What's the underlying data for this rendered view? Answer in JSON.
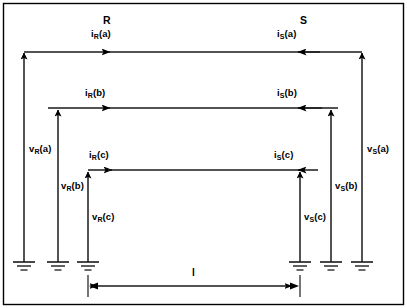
{
  "figure": {
    "type": "electrical-transmission-line-diagram",
    "border_color": "#000000",
    "line_color": "#1a1a1a",
    "background": "#ffffff",
    "width": 407,
    "height": 308
  },
  "terminals": {
    "left": {
      "label": "R",
      "x": 108,
      "y": 18
    },
    "right": {
      "label": "S",
      "x": 305,
      "y": 18
    }
  },
  "currents": {
    "left": [
      {
        "var": "i",
        "sub": "R",
        "arg": "(a)",
        "text": "iR(a)",
        "x": 94,
        "y": 31
      },
      {
        "var": "i",
        "sub": "R",
        "arg": "(b)",
        "text": "iR(b)",
        "x": 88,
        "y": 90
      },
      {
        "var": "i",
        "sub": "R",
        "arg": "(c)",
        "text": "iR(c)",
        "x": 92,
        "y": 152
      }
    ],
    "right": [
      {
        "var": "i",
        "sub": "S",
        "arg": "(a)",
        "text": "iS(a)",
        "x": 280,
        "y": 31
      },
      {
        "var": "i",
        "sub": "S",
        "arg": "(b)",
        "text": "iS(b)",
        "x": 280,
        "y": 90
      },
      {
        "var": "i",
        "sub": "S",
        "arg": "(c)",
        "text": "iS(c)",
        "x": 277,
        "y": 152
      }
    ]
  },
  "voltages": {
    "left": [
      {
        "var": "v",
        "sub": "R",
        "arg": "(a)",
        "text": "vR(a)",
        "x": 29,
        "y": 146
      },
      {
        "var": "v",
        "sub": "R",
        "arg": "(b)",
        "text": "vR(b)",
        "x": 62,
        "y": 183
      },
      {
        "var": "v",
        "sub": "R",
        "arg": "(c)",
        "text": "vR(c)",
        "x": 92,
        "y": 214
      }
    ],
    "right": [
      {
        "var": "v",
        "sub": "S",
        "arg": "(a)",
        "text": "vS(a)",
        "x": 368,
        "y": 146
      },
      {
        "var": "v",
        "sub": "S",
        "arg": "(b)",
        "text": "vS(b)",
        "x": 334,
        "y": 183
      },
      {
        "var": "v",
        "sub": "S",
        "arg": "(c)",
        "text": "vS(c)",
        "x": 305,
        "y": 214
      }
    ]
  },
  "dimension": {
    "label": "l",
    "label_x": 192,
    "label_y": 269,
    "from_x": 88,
    "to_x": 300,
    "y": 286
  },
  "conductors": [
    {
      "name": "phase-a",
      "y": 52,
      "left_x": 24,
      "right_x": 362,
      "left_arrow_tip_x": 116,
      "right_arrow_tip_x": 297
    },
    {
      "name": "phase-b",
      "y": 108,
      "left_x": 48,
      "right_x": 338,
      "left_arrow_tip_x": 116,
      "right_arrow_tip_x": 297
    },
    {
      "name": "phase-c",
      "y": 170,
      "left_x": 88,
      "right_x": 300,
      "left_arrow_tip_x": 116,
      "right_arrow_tip_x": 297
    }
  ],
  "verticals": {
    "left": [
      {
        "name": "vR-a",
        "x": 24,
        "top_y": 52,
        "ground_y": 262
      },
      {
        "name": "vR-b",
        "x": 58,
        "top_y": 110,
        "ground_y": 262
      },
      {
        "name": "vR-c",
        "x": 88,
        "top_y": 172,
        "ground_y": 262
      }
    ],
    "right": [
      {
        "name": "vS-a",
        "x": 362,
        "top_y": 52,
        "ground_y": 262
      },
      {
        "name": "vS-b",
        "x": 331,
        "top_y": 110,
        "ground_y": 262
      },
      {
        "name": "vS-c",
        "x": 300,
        "top_y": 172,
        "ground_y": 262
      }
    ]
  }
}
